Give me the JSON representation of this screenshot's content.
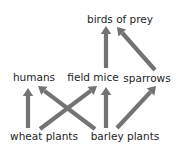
{
  "diagram": {
    "type": "food-web",
    "arrow_color": "#737373",
    "text_color": "#1e1e1e",
    "background": "#ffffff",
    "nodes": [
      {
        "id": "birds_of_prey",
        "label": "birds of prey",
        "x": 120,
        "y": 19
      },
      {
        "id": "humans",
        "label": "humans",
        "x": 34,
        "y": 77
      },
      {
        "id": "field_mice",
        "label": "field mice",
        "x": 93,
        "y": 77
      },
      {
        "id": "sparrows",
        "label": "sparrows",
        "x": 147,
        "y": 78
      },
      {
        "id": "wheat_plants",
        "label": "wheat plants",
        "x": 44,
        "y": 136
      },
      {
        "id": "barley_plants",
        "label": "barley plants",
        "x": 125,
        "y": 136
      }
    ],
    "edges": [
      {
        "from": "wheat_plants",
        "to": "humans",
        "x1": 28,
        "y1": 128,
        "x2": 28,
        "y2": 88
      },
      {
        "from": "wheat_plants",
        "to": "field_mice",
        "x1": 40,
        "y1": 129,
        "x2": 97,
        "y2": 86
      },
      {
        "from": "barley_plants",
        "to": "humans",
        "x1": 95,
        "y1": 129,
        "x2": 38,
        "y2": 86
      },
      {
        "from": "barley_plants",
        "to": "field_mice",
        "x1": 106,
        "y1": 128,
        "x2": 106,
        "y2": 87
      },
      {
        "from": "barley_plants",
        "to": "sparrows",
        "x1": 117,
        "y1": 128,
        "x2": 156,
        "y2": 86
      },
      {
        "from": "field_mice",
        "to": "birds_of_prey",
        "x1": 106,
        "y1": 68,
        "x2": 106,
        "y2": 26
      },
      {
        "from": "sparrows",
        "to": "birds_of_prey",
        "x1": 155,
        "y1": 70,
        "x2": 117,
        "y2": 27
      }
    ]
  }
}
